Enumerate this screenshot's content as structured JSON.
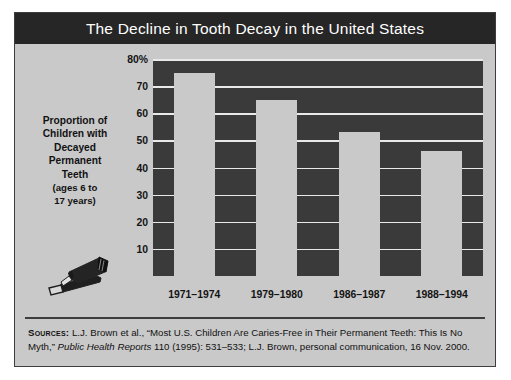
{
  "figure": {
    "title": "The Decline in Tooth Decay in the United States",
    "axis_caption_lines": [
      "Proportion of",
      "Children with",
      "Decayed",
      "Permanent",
      "Teeth"
    ],
    "axis_caption_sub_lines": [
      "(ages 6 to",
      "17 years)"
    ],
    "icon_name": "toothpaste-tube-and-toothbrush-icon"
  },
  "sources": {
    "label": "Sources:",
    "text_before_italic": " L.J. Brown et al., “Most U.S. Children Are Caries-Free in Their Permanent Teeth: This Is No Myth,” ",
    "italic_title": "Public Health Reports",
    "text_after_italic": " 110 (1995): 531–533; L.J. Brown, personal communication, 16 Nov. 2000."
  },
  "colors": {
    "title_bar": "#262626",
    "title_text": "#ffffff",
    "panel_background": "#c9c9c9",
    "plot_background": "#3a3a3a",
    "bar_fill": "#c9c9c9",
    "gridline": "#e9e9e9",
    "border": "#3d3d3d",
    "text": "#121212"
  },
  "chart_data": {
    "type": "bar",
    "title": "The Decline in Tooth Decay in the United States",
    "xlabel": "",
    "ylabel": "Proportion of Children with Decayed Permanent Teeth (ages 6 to 17 years)",
    "categories": [
      "1971–1974",
      "1979–1980",
      "1986–1987",
      "1988–1994"
    ],
    "values": [
      75,
      65,
      53,
      46
    ],
    "ylim": [
      0,
      80
    ],
    "ytick_values": [
      10,
      20,
      30,
      40,
      50,
      60,
      70,
      80
    ],
    "ytick_labels": [
      "10",
      "20",
      "30",
      "40",
      "50",
      "60",
      "70",
      "80%"
    ],
    "grid": true,
    "legend": "none",
    "unit": "%"
  }
}
